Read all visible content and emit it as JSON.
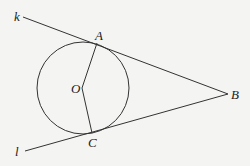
{
  "diagram": {
    "colors": {
      "background": "#f4f4f2",
      "stroke": "#333333",
      "label": "#222222"
    },
    "circle": {
      "center_label": "O",
      "cx": 83,
      "cy": 88,
      "r": 46
    },
    "points": {
      "A": {
        "label": "A",
        "x": 97,
        "y": 43
      },
      "B": {
        "label": "B",
        "x": 228,
        "y": 94
      },
      "C": {
        "label": "C",
        "x": 92,
        "y": 133
      },
      "O": {
        "label": "O",
        "x": 82,
        "y": 88
      }
    },
    "lines": {
      "k": {
        "label": "k",
        "from": [
          23,
          17
        ],
        "to": [
          228,
          94
        ]
      },
      "l": {
        "label": "l",
        "from": [
          25,
          151
        ],
        "to": [
          228,
          94
        ]
      }
    },
    "segments": [
      {
        "name": "OA",
        "from": "O",
        "to": "A"
      },
      {
        "name": "OC",
        "from": "O",
        "to": "C"
      }
    ]
  }
}
